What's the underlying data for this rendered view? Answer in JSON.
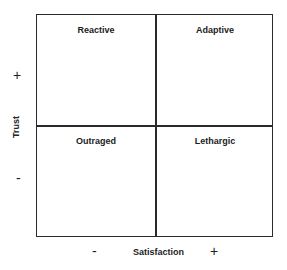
{
  "diagram": {
    "type": "2x2 matrix",
    "quadrants": {
      "top_left": "Reactive",
      "top_right": "Adaptive",
      "bottom_left": "Outraged",
      "bottom_right": "Lethargic"
    },
    "y_axis": {
      "label": "Trust",
      "high_sign": "+",
      "low_sign": "-"
    },
    "x_axis": {
      "label": "Satisfaction",
      "low_sign": "-",
      "high_sign": "+"
    },
    "line_color": "#2a2a2a"
  }
}
